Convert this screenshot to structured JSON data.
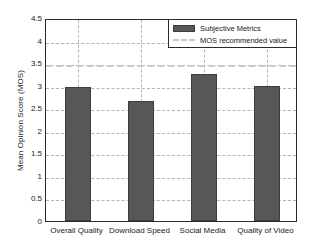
{
  "chart_data": {
    "type": "bar",
    "title": "",
    "xlabel": "",
    "ylabel": "Mean Opinion Score (MOS)",
    "categories": [
      "Overall Quality",
      "Download Speed",
      "Social Media",
      "Quality of Video"
    ],
    "values": [
      2.97,
      2.65,
      3.25,
      3.0
    ],
    "series": [
      {
        "name": "Subjective Metrics",
        "values": [
          2.97,
          2.65,
          3.25,
          3.0
        ]
      }
    ],
    "reference_line": {
      "name": "MOS recommended value",
      "value": 3.5
    },
    "ylim": [
      0,
      4.5
    ],
    "yticks": [
      "0",
      "0.5",
      "1",
      "1.5",
      "2",
      "2.5",
      "3",
      "3.5",
      "4",
      "4.5"
    ],
    "ytick_values": [
      0,
      0.5,
      1,
      1.5,
      2,
      2.5,
      3,
      3.5,
      4,
      4.5
    ],
    "grid": true,
    "legend_position": "top-right",
    "legend": [
      {
        "label": "Subjective Metrics",
        "marker": "bar-swatch",
        "color": "#575757"
      },
      {
        "label": "MOS recommended value",
        "marker": "dashed-line",
        "color": "#c9c9c9"
      }
    ],
    "colors": {
      "bar_fill": "#575757",
      "bar_edge": "#3d3d3d",
      "grid": "#b4b4b4",
      "axis": "#2b2b2b",
      "reference_line": "#c9c9c9",
      "background": "#ffffff"
    }
  }
}
